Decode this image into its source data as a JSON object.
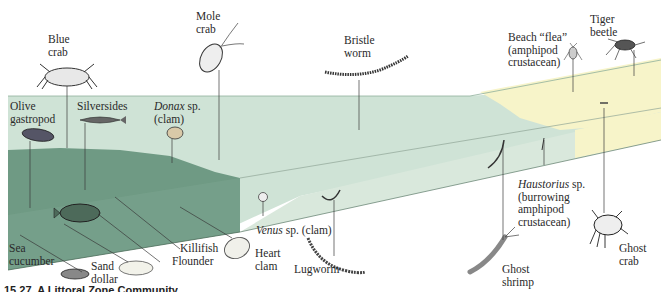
{
  "figure": {
    "caption": "15.27  A Littoral Zone Community",
    "colors": {
      "deep_water": "#6f9a84",
      "shallow_water": "#cfe3d6",
      "dry_sand": "#f6f3c6",
      "leader_line": "#3a3a3a"
    },
    "labels": {
      "blue_crab": "Blue\ncrab",
      "mole_crab": "Mole\ncrab",
      "bristle_worm": "Bristle\nworm",
      "beach_flea": "Beach “flea”\n(amphipod\ncrustacean)",
      "tiger_beetle": "Tiger\nbeetle",
      "olive_gastropod": "Olive\ngastropod",
      "silversides": "Silversides",
      "donax_genus": "Donax",
      "donax_rest": " sp.\n(clam)",
      "haustorius_genus": "Haustorius",
      "haustorius_rest": " sp.\n(burrowing\namphipod\ncrustacean)",
      "venus_genus": "Venus",
      "venus_rest": " sp. (clam)",
      "sea_cucumber": "Sea\ncucumber",
      "sand_dollar": "Sand\ndollar",
      "flounder": "Flounder",
      "killifish": "Killifish",
      "heart_clam": "Heart\nclam",
      "lugworm": "Lugworm",
      "ghost_shrimp": "Ghost\nshrimp",
      "ghost_crab": "Ghost\ncrab"
    },
    "zones": [
      "subtidal (deep water)",
      "intertidal (shallow water)",
      "supratidal (dry sand)"
    ]
  }
}
